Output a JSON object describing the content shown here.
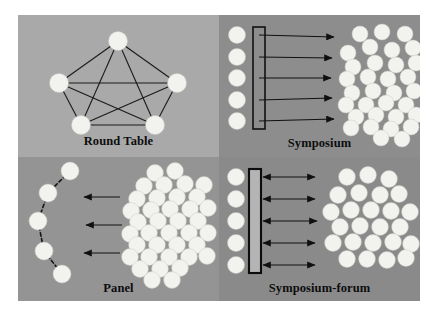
{
  "figure": {
    "background_color": "#ffffff",
    "frame_color": "#8e8e8e",
    "quadrants": [
      {
        "id": "round-table",
        "label": "Round Table",
        "background_color": "#a9a9a9",
        "diagram_type": "complete-graph",
        "seat_count": 5,
        "edge_count": 10,
        "audience_count": 0,
        "arrow_count": 0,
        "seats": [
          {
            "cx": 100,
            "cy": 26,
            "r": 9.5
          },
          {
            "cx": 41,
            "cy": 68,
            "r": 9.5
          },
          {
            "cx": 159,
            "cy": 68,
            "r": 9.5
          },
          {
            "cx": 63,
            "cy": 110,
            "r": 9.5
          },
          {
            "cx": 137,
            "cy": 110,
            "r": 9.5
          }
        ],
        "edges": [
          [
            0,
            1
          ],
          [
            0,
            2
          ],
          [
            0,
            3
          ],
          [
            0,
            4
          ],
          [
            1,
            2
          ],
          [
            1,
            3
          ],
          [
            1,
            4
          ],
          [
            2,
            3
          ],
          [
            2,
            4
          ],
          [
            3,
            4
          ]
        ]
      },
      {
        "id": "symposium",
        "label": "Symposium",
        "background_color": "#8d8d8d",
        "diagram_type": "row-panel-to-audience",
        "seat_count": 5,
        "arrow_count": 5,
        "arrow_direction": "right",
        "table_style": "outline",
        "audience_count": 33,
        "seats": [
          {
            "cx": 18,
            "cy": 20,
            "r": 8.5
          },
          {
            "cx": 18,
            "cy": 42,
            "r": 8.5
          },
          {
            "cx": 18,
            "cy": 63,
            "r": 8.5
          },
          {
            "cx": 18,
            "cy": 85,
            "r": 8.5
          },
          {
            "cx": 18,
            "cy": 106,
            "r": 8.5
          }
        ],
        "table": {
          "x": 34,
          "y": 12,
          "width": 12,
          "height": 102
        },
        "arrows": [
          {
            "x1": 40,
            "y1": 20,
            "x2": 115,
            "y2": 22
          },
          {
            "x1": 40,
            "y1": 42,
            "x2": 113,
            "y2": 43
          },
          {
            "x1": 40,
            "y1": 63,
            "x2": 112,
            "y2": 63
          },
          {
            "x1": 40,
            "y1": 85,
            "x2": 113,
            "y2": 83
          },
          {
            "x1": 40,
            "y1": 106,
            "x2": 115,
            "y2": 104
          }
        ],
        "audience": [
          {
            "cx": 141,
            "cy": 19
          },
          {
            "cx": 163,
            "cy": 17
          },
          {
            "cx": 186,
            "cy": 19
          },
          {
            "cx": 129,
            "cy": 38
          },
          {
            "cx": 151,
            "cy": 32
          },
          {
            "cx": 173,
            "cy": 35
          },
          {
            "cx": 194,
            "cy": 33
          },
          {
            "cx": 134,
            "cy": 52
          },
          {
            "cx": 156,
            "cy": 48
          },
          {
            "cx": 177,
            "cy": 50
          },
          {
            "cx": 197,
            "cy": 48
          },
          {
            "cx": 128,
            "cy": 64
          },
          {
            "cx": 149,
            "cy": 62
          },
          {
            "cx": 169,
            "cy": 64
          },
          {
            "cx": 189,
            "cy": 62
          },
          {
            "cx": 133,
            "cy": 78
          },
          {
            "cx": 154,
            "cy": 76
          },
          {
            "cx": 175,
            "cy": 78
          },
          {
            "cx": 195,
            "cy": 76
          },
          {
            "cx": 127,
            "cy": 90
          },
          {
            "cx": 147,
            "cy": 90
          },
          {
            "cx": 167,
            "cy": 88
          },
          {
            "cx": 187,
            "cy": 90
          },
          {
            "cx": 137,
            "cy": 102
          },
          {
            "cx": 157,
            "cy": 100
          },
          {
            "cx": 177,
            "cy": 102
          },
          {
            "cx": 197,
            "cy": 100
          },
          {
            "cx": 132,
            "cy": 113
          },
          {
            "cx": 152,
            "cy": 112
          },
          {
            "cx": 172,
            "cy": 114
          },
          {
            "cx": 192,
            "cy": 112
          },
          {
            "cx": 162,
            "cy": 123
          },
          {
            "cx": 183,
            "cy": 124
          }
        ]
      },
      {
        "id": "panel",
        "label": "Panel",
        "background_color": "#949494",
        "diagram_type": "arc-panel-to-audience",
        "seat_count": 5,
        "arrow_count": 3,
        "arrow_direction": "left",
        "audience_count": 38,
        "seats": [
          {
            "cx": 52,
            "cy": 14,
            "r": 9
          },
          {
            "cx": 30,
            "cy": 36,
            "r": 9
          },
          {
            "cx": 20,
            "cy": 64,
            "r": 9
          },
          {
            "cx": 26,
            "cy": 94,
            "r": 9
          },
          {
            "cx": 44,
            "cy": 117,
            "r": 9
          }
        ],
        "connectors": [
          [
            0,
            1
          ],
          [
            1,
            2
          ],
          [
            2,
            3
          ],
          [
            3,
            4
          ]
        ],
        "arrows": [
          {
            "x1": 102,
            "y1": 40,
            "x2": 66,
            "y2": 40
          },
          {
            "x1": 104,
            "y1": 68,
            "x2": 68,
            "y2": 68
          },
          {
            "x1": 102,
            "y1": 96,
            "x2": 66,
            "y2": 96
          }
        ],
        "audience": [
          {
            "cx": 137,
            "cy": 16
          },
          {
            "cx": 157,
            "cy": 14
          },
          {
            "cx": 126,
            "cy": 29
          },
          {
            "cx": 146,
            "cy": 28
          },
          {
            "cx": 167,
            "cy": 27
          },
          {
            "cx": 186,
            "cy": 28
          },
          {
            "cx": 119,
            "cy": 42
          },
          {
            "cx": 139,
            "cy": 41
          },
          {
            "cx": 159,
            "cy": 40
          },
          {
            "cx": 179,
            "cy": 40
          },
          {
            "cx": 113,
            "cy": 54
          },
          {
            "cx": 133,
            "cy": 53
          },
          {
            "cx": 152,
            "cy": 52
          },
          {
            "cx": 172,
            "cy": 52
          },
          {
            "cx": 190,
            "cy": 51
          },
          {
            "cx": 120,
            "cy": 65
          },
          {
            "cx": 140,
            "cy": 64
          },
          {
            "cx": 160,
            "cy": 64
          },
          {
            "cx": 180,
            "cy": 64
          },
          {
            "cx": 112,
            "cy": 77
          },
          {
            "cx": 131,
            "cy": 76
          },
          {
            "cx": 151,
            "cy": 76
          },
          {
            "cx": 171,
            "cy": 76
          },
          {
            "cx": 190,
            "cy": 76
          },
          {
            "cx": 119,
            "cy": 88
          },
          {
            "cx": 139,
            "cy": 88
          },
          {
            "cx": 159,
            "cy": 88
          },
          {
            "cx": 179,
            "cy": 88
          },
          {
            "cx": 112,
            "cy": 100
          },
          {
            "cx": 131,
            "cy": 100
          },
          {
            "cx": 151,
            "cy": 100
          },
          {
            "cx": 171,
            "cy": 100
          },
          {
            "cx": 189,
            "cy": 99
          },
          {
            "cx": 122,
            "cy": 112
          },
          {
            "cx": 142,
            "cy": 112
          },
          {
            "cx": 162,
            "cy": 111
          },
          {
            "cx": 134,
            "cy": 123
          },
          {
            "cx": 154,
            "cy": 123
          }
        ]
      },
      {
        "id": "symposium-forum",
        "label": "Symposium-forum",
        "background_color": "#8a8a8a",
        "diagram_type": "row-panel-bidirectional-audience",
        "seat_count": 5,
        "arrow_count": 5,
        "arrow_direction": "both",
        "table_style": "filled",
        "audience_count": 25,
        "seats": [
          {
            "cx": 17,
            "cy": 20,
            "r": 8.5
          },
          {
            "cx": 17,
            "cy": 42,
            "r": 8.5
          },
          {
            "cx": 17,
            "cy": 64,
            "r": 8.5
          },
          {
            "cx": 17,
            "cy": 86,
            "r": 8.5
          },
          {
            "cx": 17,
            "cy": 108,
            "r": 8.5
          }
        ],
        "table": {
          "x": 30,
          "y": 12,
          "width": 12,
          "height": 104
        },
        "arrows": [
          {
            "x1": 44,
            "y1": 20,
            "x2": 96,
            "y2": 20
          },
          {
            "x1": 44,
            "y1": 42,
            "x2": 96,
            "y2": 42
          },
          {
            "x1": 44,
            "y1": 64,
            "x2": 98,
            "y2": 64
          },
          {
            "x1": 44,
            "y1": 86,
            "x2": 96,
            "y2": 86
          },
          {
            "x1": 44,
            "y1": 108,
            "x2": 96,
            "y2": 108
          }
        ],
        "audience": [
          {
            "cx": 128,
            "cy": 20
          },
          {
            "cx": 149,
            "cy": 18
          },
          {
            "cx": 170,
            "cy": 22
          },
          {
            "cx": 119,
            "cy": 38
          },
          {
            "cx": 140,
            "cy": 36
          },
          {
            "cx": 161,
            "cy": 38
          },
          {
            "cx": 180,
            "cy": 37
          },
          {
            "cx": 112,
            "cy": 55
          },
          {
            "cx": 132,
            "cy": 53
          },
          {
            "cx": 152,
            "cy": 53
          },
          {
            "cx": 172,
            "cy": 54
          },
          {
            "cx": 191,
            "cy": 55
          },
          {
            "cx": 121,
            "cy": 70
          },
          {
            "cx": 141,
            "cy": 69
          },
          {
            "cx": 161,
            "cy": 70
          },
          {
            "cx": 181,
            "cy": 70
          },
          {
            "cx": 114,
            "cy": 86
          },
          {
            "cx": 134,
            "cy": 85
          },
          {
            "cx": 154,
            "cy": 86
          },
          {
            "cx": 174,
            "cy": 85
          },
          {
            "cx": 192,
            "cy": 87
          },
          {
            "cx": 128,
            "cy": 102
          },
          {
            "cx": 148,
            "cy": 102
          },
          {
            "cx": 168,
            "cy": 103
          },
          {
            "cx": 187,
            "cy": 101
          }
        ]
      }
    ]
  }
}
